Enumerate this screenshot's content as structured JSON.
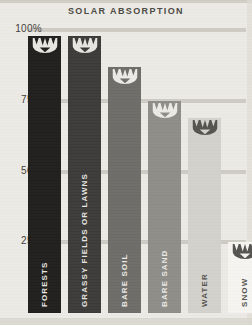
{
  "chart_data": {
    "type": "bar",
    "title": "SOLAR ABSORPTION",
    "xlabel": "",
    "ylabel": "",
    "ylim": [
      0,
      100
    ],
    "yticks": [
      "100%",
      "75%",
      "50%",
      "25%"
    ],
    "ytick_values": [
      100,
      75,
      50,
      25
    ],
    "grid": true,
    "legend": "none",
    "categories": [
      "FORESTS",
      "GRASSY FIELDS OR LAWNS",
      "BARE SOIL",
      "BARE SAND",
      "WATER",
      "SNOW"
    ],
    "values": [
      98,
      98,
      87,
      75,
      69,
      25
    ],
    "bar_colors": [
      "#201f1e",
      "#3c3b39",
      "#6e6c68",
      "#8f8d88",
      "#d3d1cb",
      "#f5f4f1"
    ],
    "label_colors": [
      "#e8e6e1",
      "#e8e6e1",
      "#eceae6",
      "#eceae6",
      "#55534f",
      "#55534f"
    ],
    "marker_icon": "sun-absorption-icon"
  },
  "chart": {
    "title": "SOLAR ABSORPTION",
    "axis": {
      "ticks": [
        {
          "label": "100%",
          "value": 100
        },
        {
          "label": "75%",
          "value": 75
        },
        {
          "label": "50%",
          "value": 50
        },
        {
          "label": "25%",
          "value": 25
        }
      ]
    },
    "bars": [
      {
        "label": "FORESTS",
        "value": 98,
        "color": "#201f1e",
        "label_color": "#e8e6e1"
      },
      {
        "label": "GRASSY FIELDS OR LAWNS",
        "value": 98,
        "color": "#3c3b39",
        "label_color": "#e8e6e1"
      },
      {
        "label": "BARE SOIL",
        "value": 87,
        "color": "#6e6c68",
        "label_color": "#eceae6"
      },
      {
        "label": "BARE SAND",
        "value": 75,
        "color": "#8f8d88",
        "label_color": "#eceae6"
      },
      {
        "label": "WATER",
        "value": 69,
        "color": "#d3d1cb",
        "label_color": "#55534f"
      },
      {
        "label": "SNOW",
        "value": 25,
        "color": "#f5f4f1",
        "label_color": "#55534f"
      }
    ]
  }
}
